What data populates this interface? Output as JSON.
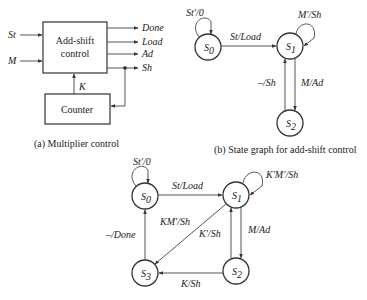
{
  "panel_a": {
    "caption": "(a) Multiplier control",
    "control_box_label_1": "Add-shift",
    "control_box_label_2": "control",
    "counter_label": "Counter",
    "inputs": [
      "St",
      "M"
    ],
    "outputs": [
      "Done",
      "Load",
      "Ad",
      "Sh"
    ],
    "feedback_label": "K"
  },
  "panel_b": {
    "caption": "(b) State graph for add-shift control",
    "states": {
      "s0": "S",
      "s0_sub": "0",
      "s1": "S",
      "s1_sub": "1",
      "s2": "S",
      "s2_sub": "2"
    },
    "transitions": {
      "s0_self": "St′/0",
      "s0_s1": "St/Load",
      "s1_self": "M′/Sh",
      "s1_s2": "M/Ad",
      "s2_s1": "–/Sh"
    }
  },
  "panel_c": {
    "states": {
      "s0": "S",
      "s0_sub": "0",
      "s1": "S",
      "s1_sub": "1",
      "s2": "S",
      "s2_sub": "2",
      "s3": "S",
      "s3_sub": "3"
    },
    "transitions": {
      "s0_self": "St′/0",
      "s0_s1": "St/Load",
      "s1_self": "K′M′/Sh",
      "s1_s2": "M/Ad",
      "s1_s3": "KM′/Sh",
      "s2_s1": "K′/Sh",
      "s2_s3": "K/Sh",
      "s3_s0": "–/Done"
    }
  }
}
